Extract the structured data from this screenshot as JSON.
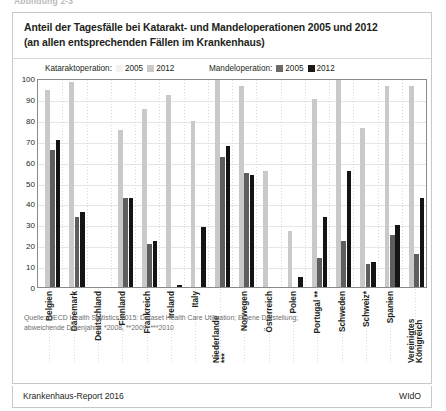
{
  "caption_strip": "Abbildung 2-3",
  "figure": {
    "title_line1": "Anteil der Tagesfälle bei Katarakt- und Mandeloperationen 2005 und 2012",
    "title_line2": "(an allen entsprechenden Fällen im Krankenhaus)"
  },
  "legend": {
    "group1_label": "Kataraktoperation:",
    "group1_items": [
      {
        "label": "2005",
        "color": "#f2f2f2"
      },
      {
        "label": "2012",
        "color": "#c9c9c9"
      }
    ],
    "group2_label": "Mandeloperation:",
    "group2_items": [
      {
        "label": "2005",
        "color": "#6b6b6b"
      },
      {
        "label": "2012",
        "color": "#1a1a1a"
      }
    ]
  },
  "source": {
    "line1": "Quelle: OECD Health Statistics 2015: Dataset Health Care Utilisation; Eigene Darstellung;",
    "line2": "abweichende Datenjahre: *2008, **2009, ***2010"
  },
  "footer": {
    "left": "Krankenhaus-Report 2016",
    "right": "WIdO"
  },
  "chart_data": {
    "type": "bar",
    "title": "Anteil der Tagesfälle bei Katarakt- und Mandeloperationen 2005 und 2012 (an allen entsprechenden Fällen im Krankenhaus)",
    "xlabel": "",
    "ylabel": "",
    "ylim": [
      0,
      100
    ],
    "yticks": [
      0,
      10,
      20,
      30,
      40,
      50,
      60,
      70,
      80,
      90,
      100
    ],
    "grid": true,
    "legend_position": "top",
    "categories": [
      "Belgien",
      "Dänemark",
      "Deutschland",
      "Finnland",
      "Frankreich",
      "Ireland",
      "Italy",
      "Niederlande ***",
      "Norwegen",
      "Österreich",
      "Polen",
      "Portugal **",
      "Schweden",
      "Schweiz*",
      "Spanien",
      "Vereinigtes Königreich"
    ],
    "series": [
      {
        "name": "Kataraktoperation 2005",
        "color": "#fcfcfc",
        "values": [
          null,
          null,
          null,
          null,
          null,
          null,
          null,
          null,
          null,
          null,
          null,
          null,
          null,
          null,
          null,
          null
        ]
      },
      {
        "name": "Kataraktoperation 2012",
        "color": "#c9c9c9",
        "values": [
          95,
          99,
          0,
          76,
          86,
          93,
          80,
          100,
          97,
          56,
          27,
          91,
          100,
          77,
          97,
          97
        ]
      },
      {
        "name": "Mandeloperation 2005",
        "color": "#5e5e5e",
        "values": [
          66,
          34,
          0,
          43,
          21,
          0,
          0,
          63,
          55,
          0,
          0,
          14,
          22,
          11,
          25,
          16
        ]
      },
      {
        "name": "Mandeloperation 2012",
        "color": "#141414",
        "values": [
          71,
          36,
          0,
          43,
          22,
          1,
          29,
          68,
          54,
          0,
          5,
          34,
          56,
          12,
          30,
          43
        ]
      }
    ]
  }
}
